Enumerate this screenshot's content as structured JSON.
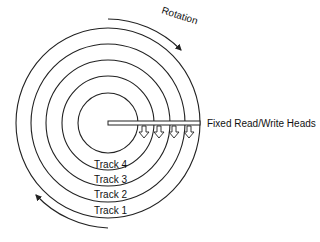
{
  "diagram": {
    "title_rotation": "Rotation",
    "heads_label": "Fixed Read/Write Heads",
    "tracks": [
      {
        "label": "Track 4"
      },
      {
        "label": "Track 3"
      },
      {
        "label": "Track 2"
      },
      {
        "label": "Track 1"
      }
    ],
    "colors": {
      "line": "#222222",
      "background": "#ffffff"
    }
  }
}
